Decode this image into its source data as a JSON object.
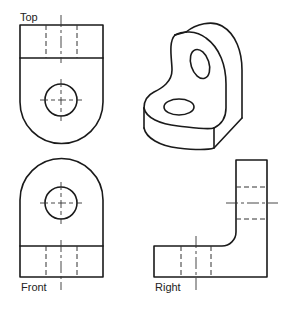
{
  "figure": {
    "views": [
      {
        "id": "top",
        "label": "Top"
      },
      {
        "id": "front",
        "label": "Front"
      },
      {
        "id": "right",
        "label": "Right"
      },
      {
        "id": "isometric",
        "label": ""
      }
    ],
    "line_color": "#1a1a1a",
    "background": "#ffffff"
  },
  "labels": {
    "top": "Top",
    "front": "Front",
    "right": "Right"
  }
}
